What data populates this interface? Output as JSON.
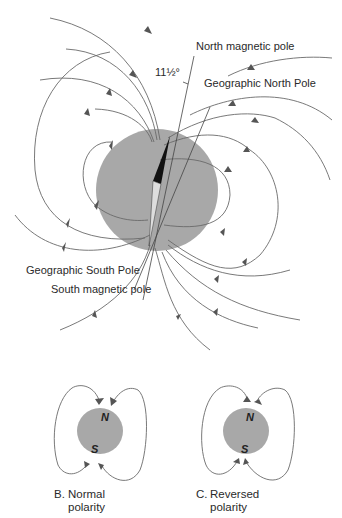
{
  "figure": {
    "main": {
      "angle_label": "11½°",
      "labels": {
        "north_magnetic_pole": "North magnetic pole",
        "geographic_north_pole": "Geographic North Pole",
        "geographic_south_pole": "Geographic South Pole",
        "south_magnetic_pole": "South magnetic pole"
      },
      "colors": {
        "earth": "#a8a8a8",
        "field_line": "#6a6a6a",
        "compass_needle": "#111111"
      }
    },
    "panels": [
      {
        "letter": "B.",
        "caption_line1": "Normal",
        "caption_line2": "polarity",
        "north": "N",
        "south": "S"
      },
      {
        "letter": "C.",
        "caption_line1": "Reversed",
        "caption_line2": "polarity",
        "north": "N",
        "south": "S"
      }
    ]
  }
}
